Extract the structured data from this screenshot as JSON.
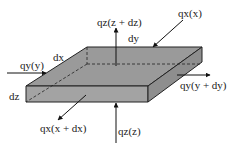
{
  "diagram": {
    "colors": {
      "top_face": "#9a9a9a",
      "front_face": "#a3a3a3",
      "side_face": "#8e8e8e",
      "stroke": "#222222",
      "background": "#ffffff"
    },
    "dimension_labels": {
      "dx": "dx",
      "dy": "dy",
      "dz": "dz"
    },
    "flux_labels": {
      "qx_in": "qₓ(x)",
      "qx_out": "qₓ(x + dx)",
      "qy_in": "qᵧ(y)",
      "qy_out": "qᵧ(y + dy)",
      "qz_in": "qₓ(z)",
      "qz_out": "qₓ(z + dz)"
    },
    "flux_labels_text": {
      "qx_in": "qx(x)",
      "qx_out": "qx(x + dx)",
      "qy_in": "qy(y)",
      "qy_out": "qy(y + dy)",
      "qz_in": "qz(z)",
      "qz_out": "qz(z + dz)"
    }
  }
}
